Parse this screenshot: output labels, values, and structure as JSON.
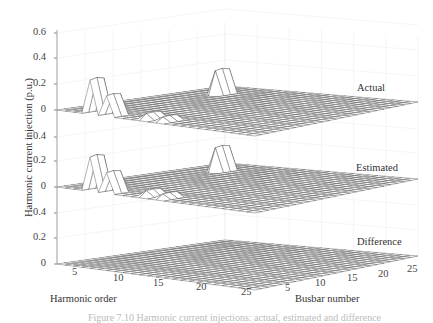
{
  "chart_data": {
    "type": "3d-surface",
    "title": "",
    "zlabel": "Harmonic current injection (p.u.)",
    "xlabel": "Harmonic order",
    "ylabel": "Busbar number",
    "x_ticks": [
      "5",
      "10",
      "15",
      "20",
      "25"
    ],
    "y_ticks": [
      "5",
      "10",
      "15",
      "20",
      "25"
    ],
    "z_ticks_stacked": [
      "0.6",
      "0.4",
      "0.2",
      "0",
      "0.4",
      "0.2",
      "0",
      "0.4",
      "0.2",
      "0"
    ],
    "x_range": [
      1,
      25
    ],
    "y_range": [
      1,
      25
    ],
    "z_range_per_layer": [
      0,
      0.6
    ],
    "grid": true,
    "layers": [
      {
        "name": "Actual",
        "peaks": [
          {
            "harmonic": 5,
            "busbar": 2,
            "value": 0.28
          },
          {
            "harmonic": 7,
            "busbar": 2,
            "value": 0.17
          },
          {
            "harmonic": 11,
            "busbar": 3,
            "value": 0.05
          },
          {
            "harmonic": 13,
            "busbar": 3,
            "value": 0.04
          },
          {
            "harmonic": 5,
            "busbar": 20,
            "value": 0.2
          }
        ]
      },
      {
        "name": "Estimated",
        "peaks": [
          {
            "harmonic": 5,
            "busbar": 2,
            "value": 0.28
          },
          {
            "harmonic": 7,
            "busbar": 2,
            "value": 0.17
          },
          {
            "harmonic": 11,
            "busbar": 3,
            "value": 0.05
          },
          {
            "harmonic": 13,
            "busbar": 3,
            "value": 0.04
          },
          {
            "harmonic": 5,
            "busbar": 20,
            "value": 0.2
          }
        ]
      },
      {
        "name": "Difference",
        "peaks": []
      }
    ]
  },
  "labels": {
    "layer_actual": "Actual",
    "layer_estimated": "Estimated",
    "layer_difference": "Difference",
    "z_axis": "Harmonic current injection (p.u.)",
    "x_axis": "Harmonic order",
    "y_axis": "Busbar number",
    "caption": "Figure 7.10   Harmonic current injections: actual, estimated and difference"
  },
  "yticks": [
    {
      "label": "0.6",
      "y": 33
    },
    {
      "label": "0.4",
      "y": 58
    },
    {
      "label": "0.2",
      "y": 84
    },
    {
      "label": "0",
      "y": 110
    },
    {
      "label": "0.4",
      "y": 137
    },
    {
      "label": "0.2",
      "y": 161
    },
    {
      "label": "0",
      "y": 187
    },
    {
      "label": "0.4",
      "y": 213
    },
    {
      "label": "0.2",
      "y": 238
    },
    {
      "label": "0",
      "y": 264
    }
  ],
  "xticks": [
    {
      "label": "5",
      "x": 72,
      "y": 267
    },
    {
      "label": "10",
      "x": 113,
      "y": 273
    },
    {
      "label": "15",
      "x": 153,
      "y": 278
    },
    {
      "label": "20",
      "x": 196,
      "y": 282
    },
    {
      "label": "25",
      "x": 241,
      "y": 287
    }
  ],
  "bticks": [
    {
      "label": "5",
      "x": 285,
      "y": 283
    },
    {
      "label": "10",
      "x": 315,
      "y": 278
    },
    {
      "label": "15",
      "x": 347,
      "y": 273
    },
    {
      "label": "20",
      "x": 378,
      "y": 269
    },
    {
      "label": "25",
      "x": 407,
      "y": 264
    }
  ]
}
